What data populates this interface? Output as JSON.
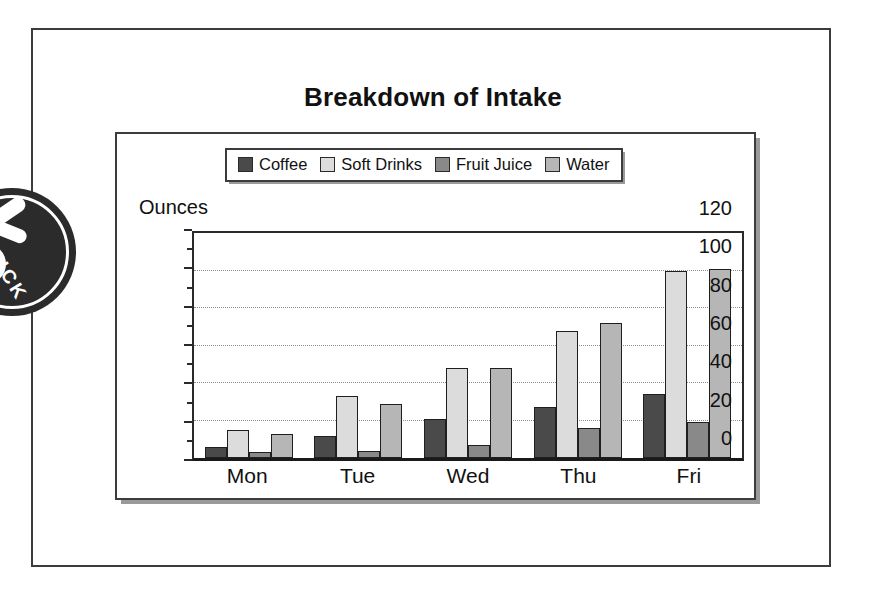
{
  "document": {
    "stamp": {
      "name": "circular-stamp",
      "text": "ICK"
    }
  },
  "chart_data": {
    "type": "bar",
    "title": "Breakdown of Intake",
    "xlabel": "",
    "ylabel": "Ounces",
    "ylim": [
      0,
      120
    ],
    "ytick_step": 20,
    "yminor_step": 10,
    "grid": true,
    "gridlines": [
      20,
      40,
      60,
      80,
      100
    ],
    "ytick_labels": [
      "0",
      "20",
      "40",
      "60",
      "80",
      "100",
      "120"
    ],
    "ytick_values": [
      0,
      20,
      40,
      60,
      80,
      100,
      120
    ],
    "legend_position": "top",
    "categories": [
      "Mon",
      "Tue",
      "Wed",
      "Thu",
      "Fri"
    ],
    "series": [
      {
        "name": "Coffee",
        "color": "#4a4a4a",
        "values": [
          6,
          12,
          21,
          27,
          34
        ]
      },
      {
        "name": "Soft Drinks",
        "color": "#dcdcdc",
        "values": [
          15,
          33,
          48,
          68,
          100
        ]
      },
      {
        "name": "Fruit Juice",
        "color": "#898989",
        "values": [
          3,
          4,
          7,
          16,
          19
        ]
      },
      {
        "name": "Water",
        "color": "#b6b6b6",
        "values": [
          13,
          29,
          48,
          72,
          101
        ]
      }
    ]
  }
}
